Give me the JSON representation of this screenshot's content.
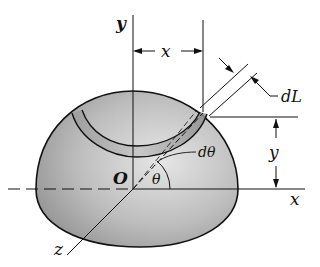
{
  "figure": {
    "labels": {
      "y_axis": "y",
      "x_axis": "x",
      "z_axis": "z",
      "origin": "O",
      "theta": "θ",
      "d_theta": "dθ",
      "dL": "dL",
      "x_dim": "x",
      "y_dim": "y"
    },
    "colors": {
      "line": "#111111",
      "shade_dark": "#8a8a8a",
      "shade_light": "#e2e2e2",
      "background": "#ffffff"
    }
  }
}
